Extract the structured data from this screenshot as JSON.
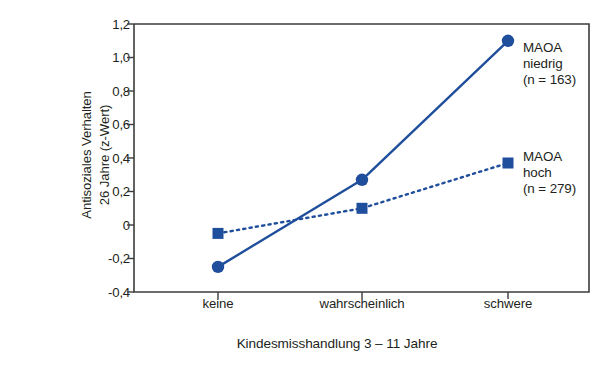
{
  "chart_data": {
    "type": "line",
    "title": "",
    "xlabel": "Kindesmisshandlung 3 – 11 Jahre",
    "ylabel": "Antisoziales Verhalten 26 Jahre (z-Wert)",
    "ylabel_line1": "Antisoziales Verhalten",
    "ylabel_line2": "26 Jahre (z-Wert)",
    "categories": [
      "keine",
      "wahrscheinlich",
      "schwere"
    ],
    "ylim": [
      -0.4,
      1.2
    ],
    "yticks": [
      1.2,
      1.0,
      0.8,
      0.6,
      0.4,
      0.2,
      0,
      -0.2,
      -0.4
    ],
    "ytick_labels": [
      "1,2",
      "1,0",
      "0,8",
      "0,6",
      "0,4",
      "0,2",
      "0",
      "-0,2",
      "-0,4"
    ],
    "grid": false,
    "legend_position": "right-inline-annotations",
    "accent_color": "#1f4e9c",
    "axis_color": "#3c3c3c",
    "series": [
      {
        "name": "MAOA niedrig",
        "label_line1": "MAOA",
        "label_line2": "niedrig",
        "label_line3": "(n = 163)",
        "n": 163,
        "marker": "circle",
        "linestyle": "solid",
        "color": "#1f4e9c",
        "values": [
          -0.25,
          0.27,
          1.1
        ]
      },
      {
        "name": "MAOA hoch",
        "label_line1": "MAOA",
        "label_line2": "hoch",
        "label_line3": "(n = 279)",
        "n": 279,
        "marker": "square",
        "linestyle": "dotted",
        "color": "#1f4e9c",
        "values": [
          -0.05,
          0.1,
          0.37
        ]
      }
    ]
  },
  "axis": {
    "ytick_0": "1,2",
    "ytick_1": "1,0",
    "ytick_2": "0,8",
    "ytick_3": "0,6",
    "ytick_4": "0,4",
    "ytick_5": "0,2",
    "ytick_6": "0",
    "ytick_7": "-0,2",
    "ytick_8": "-0,4",
    "xtick_0": "keine",
    "xtick_1": "wahrscheinlich",
    "xtick_2": "schwere",
    "xtitle": "Kindesmisshandlung 3 – 11 Jahre",
    "ytitle_line1": "Antisoziales Verhalten",
    "ytitle_line2": "26 Jahre (z-Wert)"
  },
  "annotations": {
    "series1_line1": "MAOA",
    "series1_line2": "niedrig",
    "series1_line3": "(n = 163)",
    "series2_line1": "MAOA",
    "series2_line2": "hoch",
    "series2_line3": "(n = 279)"
  }
}
